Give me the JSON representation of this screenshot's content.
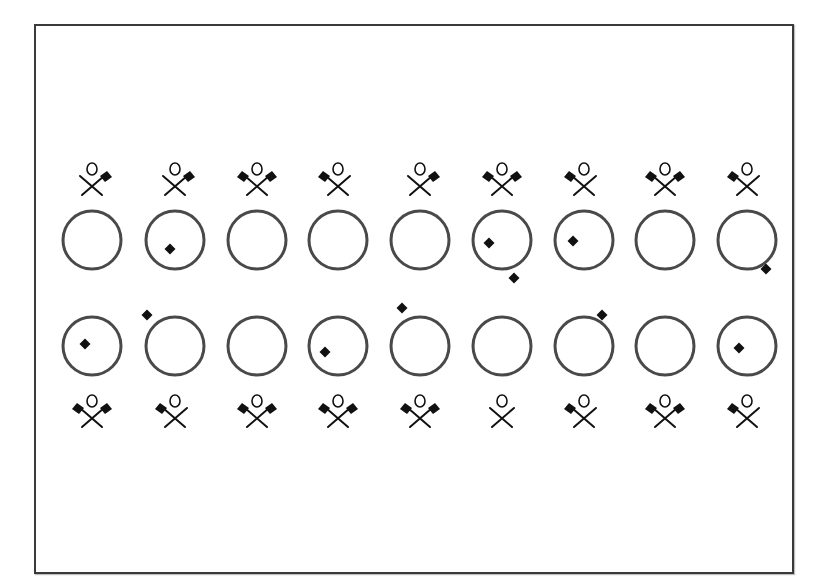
{
  "figure": {
    "frame": {
      "x": 34,
      "y": 24,
      "width": 760,
      "height": 550
    },
    "circle_radius": 29,
    "stroke_color": "#4a4a4a",
    "flag_color": "#111111",
    "column_x": [
      92,
      175,
      257,
      338,
      420,
      502,
      584,
      665,
      747
    ],
    "top_row": {
      "figure_y": 180,
      "circle_y": 240,
      "items": [
        {
          "figure_flags": "right",
          "dot": null
        },
        {
          "figure_flags": "right",
          "dot": {
            "dx": -5,
            "dy": 9
          }
        },
        {
          "figure_flags": "both",
          "dot": null
        },
        {
          "figure_flags": "left",
          "dot": null
        },
        {
          "figure_flags": "right",
          "dot": null
        },
        {
          "figure_flags": "both",
          "dot": {
            "dx": -13,
            "dy": 3
          },
          "dot2": {
            "dx": 12,
            "dy": 38
          }
        },
        {
          "figure_flags": "left",
          "dot": {
            "dx": -11,
            "dy": 1
          }
        },
        {
          "figure_flags": "both",
          "dot": null
        },
        {
          "figure_flags": "left",
          "dot": {
            "dx": 19,
            "dy": 29
          }
        }
      ]
    },
    "bottom_row": {
      "circle_y": 346,
      "figure_y": 412,
      "items": [
        {
          "figure_flags": "both",
          "dot": {
            "dx": -7,
            "dy": -2
          }
        },
        {
          "figure_flags": "left",
          "dot": {
            "dx": -28,
            "dy": -31
          }
        },
        {
          "figure_flags": "both",
          "dot": null
        },
        {
          "figure_flags": "both",
          "dot": {
            "dx": -13,
            "dy": 6
          }
        },
        {
          "figure_flags": "both",
          "dot": {
            "dx": -18,
            "dy": -38
          }
        },
        {
          "figure_flags": "none",
          "dot": null
        },
        {
          "figure_flags": "left",
          "dot": {
            "dx": 18,
            "dy": -31
          }
        },
        {
          "figure_flags": "both",
          "dot": null
        },
        {
          "figure_flags": "left",
          "dot": {
            "dx": -8,
            "dy": 2
          }
        }
      ]
    }
  }
}
